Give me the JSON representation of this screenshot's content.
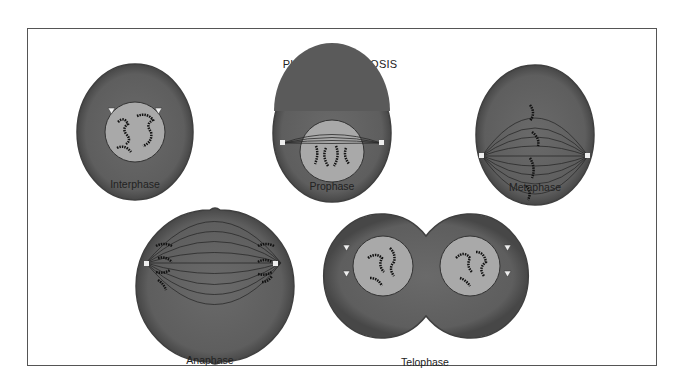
{
  "title": "PHASES OF MITOSIS",
  "phases": [
    {
      "name": "Interphase"
    },
    {
      "name": "Prophase"
    },
    {
      "name": "Metaphase"
    },
    {
      "name": "Anaphase"
    },
    {
      "name": "Telophase"
    }
  ],
  "colors": {
    "cytoplasm": "#5e5e5e",
    "cytoplasm_edge": "#3f3f3f",
    "nucleus": "#a9a9a9",
    "spindle": "#2a2a2a",
    "frame": "#555555"
  }
}
